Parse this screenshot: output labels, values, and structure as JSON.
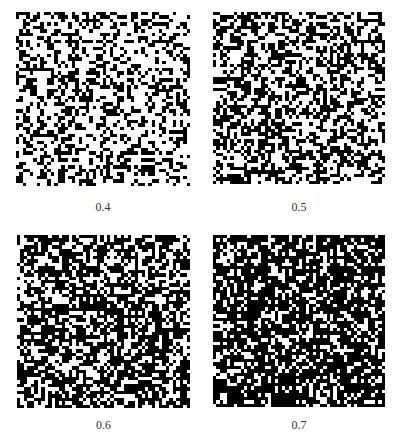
{
  "figure": {
    "panels": [
      {
        "label": "0.4",
        "density": 0.4,
        "seed": 11,
        "x": 16,
        "y": 12,
        "size": 174,
        "label_y": 200
      },
      {
        "label": "0.5",
        "density": 0.5,
        "seed": 23,
        "x": 213,
        "y": 12,
        "size": 172,
        "label_y": 200
      },
      {
        "label": "0.6",
        "density": 0.6,
        "seed": 37,
        "x": 17,
        "y": 235,
        "size": 173,
        "label_y": 418
      },
      {
        "label": "0.7",
        "density": 0.7,
        "seed": 53,
        "x": 213,
        "y": 235,
        "size": 172,
        "label_y": 418
      }
    ],
    "grid_cells": 50,
    "colors": {
      "on": "#000000",
      "off": "#ffffff"
    },
    "caption_visible": "truncated (illegible)"
  }
}
